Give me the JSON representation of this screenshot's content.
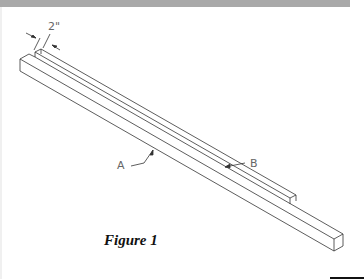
{
  "figure": {
    "caption": "Figure 1",
    "dimension_label": "2\"",
    "callouts": [
      {
        "id": "A",
        "label": "A"
      },
      {
        "id": "B",
        "label": "B"
      }
    ],
    "colors": {
      "line": "#333333",
      "top_strip": "#a9a9a9",
      "label": "#666666"
    }
  }
}
